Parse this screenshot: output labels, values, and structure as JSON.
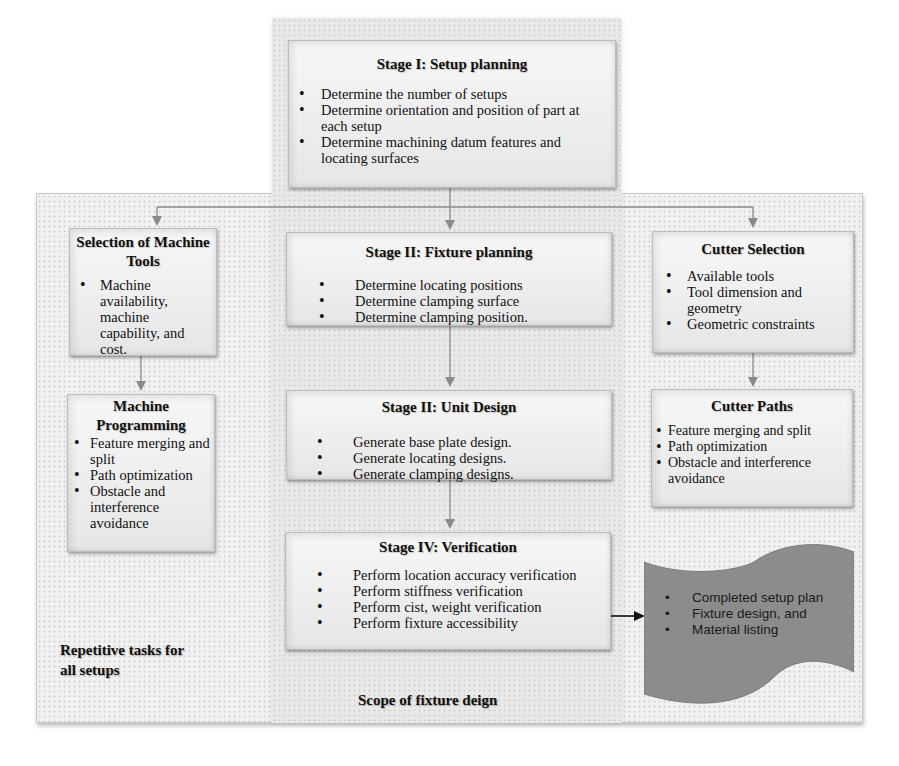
{
  "diagram": {
    "stage1": {
      "title": "Stage I: Setup planning",
      "items": [
        "Determine the number of setups",
        "Determine orientation and position of part at each setup",
        "Determine machining datum features and locating surfaces"
      ]
    },
    "machine_tools": {
      "title": "Selection of Machine Tools",
      "items": [
        "Machine availability, machine capability, and cost."
      ]
    },
    "machine_programming": {
      "title": "Machine Programming",
      "items": [
        "Feature merging and split",
        "Path optimization",
        "Obstacle and interference avoidance"
      ]
    },
    "stage2": {
      "title": "Stage II:  Fixture planning",
      "items": [
        "Determine locating positions",
        "Determine clamping surface",
        "Determine clamping position."
      ]
    },
    "stage3": {
      "title": "Stage II: Unit Design",
      "items": [
        "Generate base plate design.",
        "Generate locating designs.",
        "Generate clamping designs."
      ]
    },
    "stage4": {
      "title": "Stage IV: Verification",
      "items": [
        "Perform location accuracy verification",
        "Perform stiffness verification",
        "Perform cist, weight verification",
        "Perform fixture accessibility"
      ]
    },
    "cutter_selection": {
      "title": "Cutter Selection",
      "items": [
        "Available tools",
        "Tool dimension and geometry",
        "Geometric constraints"
      ]
    },
    "cutter_paths": {
      "title": "Cutter Paths",
      "items": [
        "Feature merging and split",
        "Path optimization",
        "Obstacle and interference avoidance"
      ]
    },
    "output": {
      "items": [
        "Completed setup plan",
        "Fixture design, and",
        "Material listing"
      ],
      "fill_color": "#8c8c8c"
    },
    "labels": {
      "repetitive": "Repetitive tasks for all setups",
      "scope": "Scope of fixture deign"
    },
    "colors": {
      "connector": "#8a8a8a",
      "arrow_output": "#111111",
      "box_border": "#bdbdbd"
    }
  }
}
